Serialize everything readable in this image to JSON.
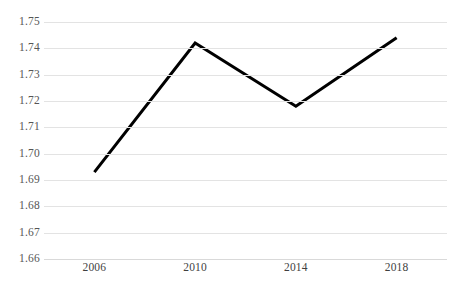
{
  "chart_data": {
    "type": "line",
    "title": "",
    "subtitle": "",
    "xlabel": "",
    "ylabel": "",
    "x": [
      2006,
      2010,
      2014,
      2018
    ],
    "categories": [
      "2006",
      "2010",
      "2014",
      "2018"
    ],
    "values": [
      1.693,
      1.742,
      1.718,
      1.744
    ],
    "series": [
      {
        "name": "",
        "values": [
          1.693,
          1.742,
          1.718,
          1.744
        ]
      }
    ],
    "ylim": [
      1.66,
      1.75
    ],
    "ytick_step": 0.01,
    "ytick_labels": [
      "1.75",
      "1.74",
      "1.73",
      "1.72",
      "1.71",
      "1.70",
      "1.69",
      "1.68",
      "1.67",
      "1.66"
    ],
    "ytick_values": [
      1.75,
      1.74,
      1.73,
      1.72,
      1.71,
      1.7,
      1.69,
      1.68,
      1.67,
      1.66
    ],
    "xtick_labels": [
      "2006",
      "2010",
      "2014",
      "2018"
    ],
    "grid": "horizontal",
    "legend": "none",
    "colors": {
      "line": "#000000",
      "gridline": "#e3e3e3",
      "baseline": "#d9d9d9",
      "ytick_text": "#555555",
      "xtick_text": "#3f3f3f",
      "background": "#ffffff"
    },
    "line_width": 3,
    "markers": "none"
  }
}
